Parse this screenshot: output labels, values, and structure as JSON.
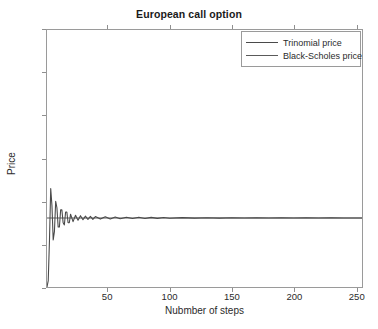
{
  "chart_data": {
    "type": "line",
    "title": "European call option",
    "xlabel": "Nubmber of steps",
    "ylabel": "Price",
    "xlim": [
      1,
      255
    ],
    "ylim": [
      1.4,
      2.6
    ],
    "xticks": [
      50,
      100,
      150,
      200,
      250
    ],
    "xtick_labels": [
      "50",
      "100",
      "150",
      "200",
      "250"
    ],
    "yticks": [
      1.4,
      1.6,
      1.8,
      2.0,
      2.2,
      2.4,
      2.6
    ],
    "ytick_labels": [
      "1.4",
      "1.6",
      "1.8",
      "2",
      "2.2",
      "2.4",
      "2.6"
    ],
    "grid": false,
    "legend_position": "upper right",
    "series": [
      {
        "name": "Trinomial price",
        "color": "#4a4a4a",
        "x": [
          1,
          2,
          3,
          4,
          5,
          6,
          7,
          8,
          9,
          10,
          11,
          12,
          13,
          14,
          15,
          16,
          17,
          18,
          19,
          20,
          22,
          24,
          26,
          28,
          30,
          32,
          34,
          36,
          38,
          40,
          44,
          48,
          52,
          56,
          60,
          65,
          70,
          75,
          80,
          85,
          90,
          95,
          100,
          110,
          120,
          130,
          140,
          150,
          160,
          170,
          180,
          190,
          200,
          210,
          220,
          230,
          240,
          250,
          255
        ],
        "values": [
          1.4,
          1.43,
          1.62,
          1.86,
          1.78,
          1.62,
          1.66,
          1.8,
          1.77,
          1.68,
          1.68,
          1.76,
          1.76,
          1.7,
          1.69,
          1.75,
          1.75,
          1.7,
          1.7,
          1.74,
          1.705,
          1.735,
          1.712,
          1.733,
          1.714,
          1.731,
          1.715,
          1.73,
          1.716,
          1.729,
          1.717,
          1.728,
          1.718,
          1.727,
          1.719,
          1.726,
          1.7195,
          1.7255,
          1.72,
          1.725,
          1.7205,
          1.7245,
          1.721,
          1.724,
          1.7215,
          1.7235,
          1.7215,
          1.7232,
          1.7218,
          1.723,
          1.7219,
          1.7228,
          1.722,
          1.7227,
          1.722,
          1.7226,
          1.7221,
          1.7225,
          1.7222
        ]
      },
      {
        "name": "Black-Scholes price",
        "color": "#5a5a5a",
        "constant_value": 1.7222
      }
    ]
  },
  "legend": {
    "items": [
      {
        "label": "Trinomial price"
      },
      {
        "label": "Black-Scholes price"
      }
    ]
  }
}
